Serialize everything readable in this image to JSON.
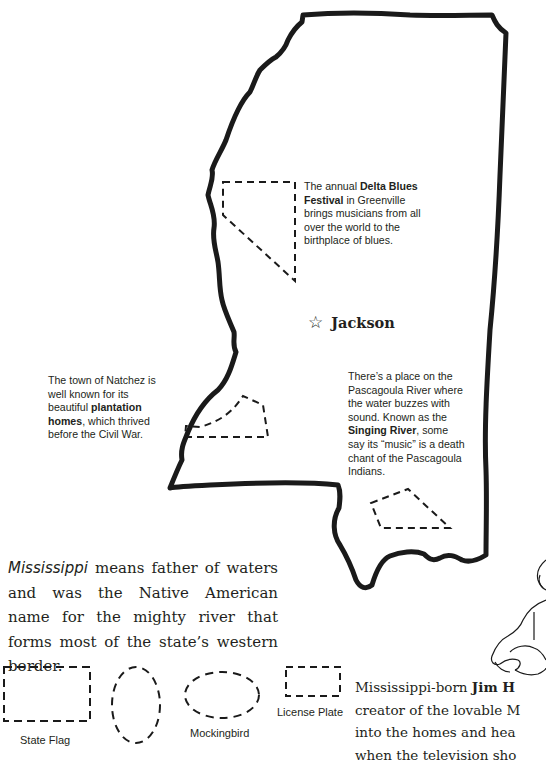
{
  "map": {
    "state": "Mississippi",
    "capital": {
      "label": "Jackson",
      "icon": "star-outline-icon"
    }
  },
  "notes": {
    "delta": {
      "pre": "The annual ",
      "bold": "Delta Blues Festival",
      "post": " in Greenville brings musicians from all over the world to the birthplace of blues."
    },
    "natchez": {
      "pre": "The town of Natchez is well known for its beautiful ",
      "bold": "plantation homes",
      "post": ", which thrived before the Civil War."
    },
    "singing_river": {
      "pre": "There’s a place on the Pascagoula River where the water buzzes with sound. Known as the ",
      "bold": "Singing River",
      "post": ", some say its “music” is a death chant of the Pascagoula Indians."
    }
  },
  "intro": {
    "italic": "Mississippi",
    "text": " means father of waters and was the Native American name for the mighty river that forms most of the state’s western border."
  },
  "symbols": [
    {
      "label": "State Flag"
    },
    {
      "label": ""
    },
    {
      "label": "Mockingbird"
    },
    {
      "label": "License Plate"
    }
  ],
  "henson": {
    "line1_pre": "Mississippi-born ",
    "line1_bold": "Jim H",
    "line2": "creator of the lovable M",
    "line3": "into the homes and hea",
    "line4": "when the television sho"
  }
}
